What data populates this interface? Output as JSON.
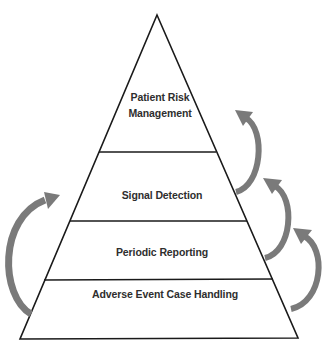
{
  "diagram": {
    "type": "pyramid",
    "levels": [
      {
        "label_line1": "Patient Risk",
        "label_line2": "Management",
        "position": "top"
      },
      {
        "label": "Signal Detection",
        "position": "upper-middle"
      },
      {
        "label": "Periodic Reporting",
        "position": "lower-middle"
      },
      {
        "label": "Adverse Event Case Handling",
        "position": "base"
      }
    ],
    "arrows": [
      {
        "side": "right",
        "from": "Signal Detection",
        "to": "Patient Risk Management",
        "direction": "up"
      },
      {
        "side": "right",
        "from": "Periodic Reporting",
        "to": "Signal Detection",
        "direction": "up"
      },
      {
        "side": "right",
        "from": "Adverse Event Case Handling",
        "to": "Periodic Reporting",
        "direction": "up"
      },
      {
        "side": "left",
        "from": "Adverse Event Case Handling",
        "to": "Signal Detection",
        "direction": "up"
      }
    ],
    "colors": {
      "outline": "#1a1a1a",
      "arrow": "#7a7a7a",
      "text": "#2e2e2e",
      "background": "#ffffff"
    }
  }
}
